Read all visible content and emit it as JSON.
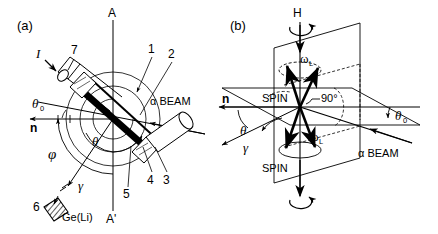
{
  "figure": {
    "panels": [
      {
        "key": "a",
        "label": "(a)",
        "description": "scattering-chamber-geometry-top-view",
        "axis_top_label": "A",
        "axis_bottom_label": "A'",
        "normal_vector_label": "n",
        "beam_label": "α BEAM",
        "gamma_label": "γ",
        "detector_label": "Ge(Li)",
        "current_label": "I",
        "angles": [
          {
            "name": "theta-zero",
            "symbol": "θ",
            "subscript": "0"
          },
          {
            "name": "theta",
            "symbol": "θ",
            "subscript": ""
          },
          {
            "name": "phi",
            "symbol": "φ",
            "subscript": ""
          }
        ],
        "part_numbers": [
          "1",
          "2",
          "3",
          "4",
          "5",
          "6",
          "7"
        ]
      },
      {
        "key": "b",
        "label": "(b)",
        "description": "spin-precession-vector-diagram",
        "field_label": "H",
        "larmor_label_upper": "ω",
        "larmor_sub_upper": "L",
        "larmor_label_lower": "ω",
        "larmor_sub_lower": "L",
        "spin_label_upper": "SPIN",
        "spin_label_lower": "SPIN",
        "right_angle_label": "90°",
        "normal_vector_label": "n",
        "beam_label": "α BEAM",
        "gamma_label": "γ",
        "angles": [
          {
            "name": "theta",
            "symbol": "θ",
            "subscript": ""
          },
          {
            "name": "theta-zero",
            "symbol": "θ",
            "subscript": "0"
          }
        ]
      }
    ],
    "colors": {
      "ink": "#000000",
      "background": "#ffffff"
    }
  }
}
